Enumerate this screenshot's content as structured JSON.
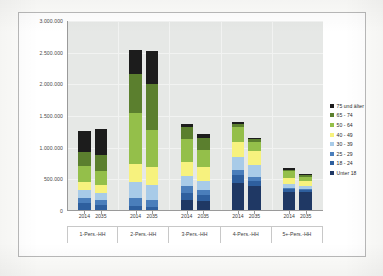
{
  "chart_data": {
    "type": "bar",
    "stacked": true,
    "title": "",
    "subtitle": "",
    "xlabel": "",
    "ylabel": "",
    "ylim": [
      0,
      3000000
    ],
    "ytick_values": [
      0,
      500000,
      1000000,
      1500000,
      2000000,
      2500000,
      3000000
    ],
    "ytick_labels": [
      "0",
      "500.000",
      "1.000.000",
      "1.500.000",
      "2.000.000",
      "2.500.000",
      "3.000.000"
    ],
    "grid": true,
    "legend_position": "right",
    "group_labels": [
      "1-Pers.-HH",
      "2-Pers.-HH",
      "3-Pers.-HH",
      "4-Pers.-HH",
      "5+-Pers.-HH"
    ],
    "x": [
      "2014",
      "2035",
      "2014",
      "2035",
      "2014",
      "2035",
      "2014",
      "2035",
      "2014",
      "2035"
    ],
    "series": [
      {
        "name": "Unter 18",
        "color": "#1f3864",
        "values": [
          0,
          0,
          0,
          0,
          170000,
          160000,
          450000,
          400000,
          300000,
          300000
        ]
      },
      {
        "name": "18 - 24",
        "color": "#2e5f9e",
        "values": [
          120000,
          100000,
          80000,
          70000,
          110000,
          90000,
          115000,
          80000,
          45000,
          30000
        ]
      },
      {
        "name": "25 - 29",
        "color": "#4a7ebb",
        "values": [
          90000,
          70000,
          130000,
          110000,
          110000,
          80000,
          85000,
          60000,
          25000,
          20000
        ]
      },
      {
        "name": "30 - 39",
        "color": "#a8cbe8",
        "values": [
          130000,
          120000,
          250000,
          230000,
          160000,
          140000,
          210000,
          180000,
          55000,
          45000
        ]
      },
      {
        "name": "40 - 49",
        "color": "#f7f27e",
        "values": [
          120000,
          120000,
          290000,
          280000,
          230000,
          220000,
          230000,
          230000,
          90000,
          80000
        ]
      },
      {
        "name": "50 - 64",
        "color": "#94bf4a",
        "values": [
          250000,
          230000,
          800000,
          590000,
          350000,
          280000,
          230000,
          140000,
          110000,
          70000
        ]
      },
      {
        "name": "65 - 74",
        "color": "#5b7f2e",
        "values": [
          220000,
          250000,
          620000,
          720000,
          190000,
          190000,
          50000,
          40000,
          30000,
          20000
        ]
      },
      {
        "name": "75 und älter",
        "color": "#1c1c1c",
        "values": [
          330000,
          410000,
          380000,
          520000,
          50000,
          60000,
          30000,
          20000,
          20000,
          15000
        ]
      }
    ],
    "totals": [
      1260000,
      1300000,
      2550000,
      2520000,
      1370000,
      1220000,
      1400000,
      1150000,
      675000,
      580000
    ]
  },
  "axis": {
    "ytick_labels": [
      "3.000.000",
      "2.500.000",
      "2.000.000",
      "1.500.000",
      "1.000.000",
      "500.000",
      "0"
    ]
  },
  "legend": {
    "items": [
      {
        "label": "75 und älter",
        "color": "#1c1c1c"
      },
      {
        "label": "65 - 74",
        "color": "#5b7f2e"
      },
      {
        "label": "50 - 64",
        "color": "#94bf4a"
      },
      {
        "label": "40 - 49",
        "color": "#f7f27e"
      },
      {
        "label": "30 - 39",
        "color": "#a8cbe8"
      },
      {
        "label": "25 - 29",
        "color": "#4a7ebb"
      },
      {
        "label": "18 - 24",
        "color": "#2e5f9e"
      },
      {
        "label": "Unter 18",
        "color": "#1f3864"
      }
    ]
  },
  "style": {
    "plot_background": "#e6e8e6",
    "frame_border": "#b9b9b9",
    "gridline_color": "#f2f3f2",
    "axis_color": "#9a9a9a",
    "paper": "#fdfdfb"
  }
}
